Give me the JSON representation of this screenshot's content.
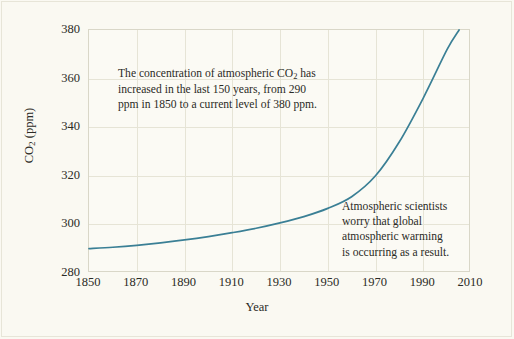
{
  "figure": {
    "background_color": "#faf9f2",
    "plot_background_color": "#fbfaf4",
    "frame_color": "#d9d7c8",
    "grid_color": "#e6e4d6",
    "line_color": "#3a7f95",
    "text_color": "#2b2b26"
  },
  "annotations": {
    "primary": "The concentration of atmospheric CO₂ has increased in the last 150 years, from 290 ppm in 1850 to a current level of 380 ppm.",
    "primary_lines": [
      "The concentration of atmospheric CO",
      "increased in the last 150 years, from 290",
      "ppm in 1850 to a current level of 380 ppm."
    ],
    "primary_prefix": "The concentration of atmospheric CO",
    "primary_sub": "2",
    "primary_suffix": " has",
    "secondary": "Atmospheric scientists worry that global atmospheric warming is occurring as a result.",
    "secondary_lines": [
      "Atmospheric scientists",
      "worry that global",
      "atmospheric warming",
      "is occurring as a result."
    ]
  },
  "axis": {
    "y_title_prefix": "CO",
    "y_title_sub": "2",
    "y_title_suffix": " (ppm)",
    "x_title": "Year",
    "x_ticks": [
      "1850",
      "1870",
      "1890",
      "1910",
      "1930",
      "1950",
      "1970",
      "1990",
      "2010"
    ],
    "y_ticks": [
      "380",
      "360",
      "340",
      "320",
      "300",
      "280"
    ]
  },
  "chart_data": {
    "type": "line",
    "title": "",
    "xlabel": "Year",
    "ylabel": "CO2 (ppm)",
    "xlim": [
      1850,
      2010
    ],
    "ylim": [
      280,
      380
    ],
    "xticks": [
      1850,
      1870,
      1890,
      1910,
      1930,
      1950,
      1970,
      1990,
      2010
    ],
    "yticks": [
      280,
      300,
      320,
      340,
      360,
      380
    ],
    "grid": true,
    "legend": false,
    "line_color": "#3a7f95",
    "series": [
      {
        "name": "Atmospheric CO2 concentration",
        "x": [
          1850,
          1860,
          1870,
          1880,
          1890,
          1900,
          1910,
          1920,
          1930,
          1940,
          1950,
          1960,
          1970,
          1980,
          1990,
          2000,
          2005
        ],
        "values": [
          290.0,
          290.6,
          291.4,
          292.4,
          293.6,
          295.0,
          296.6,
          298.4,
          300.6,
          303.2,
          306.6,
          311.4,
          320.0,
          334.0,
          352.0,
          372.0,
          380.0
        ]
      }
    ],
    "annotations": [
      {
        "text": "The concentration of atmospheric CO2 has increased in the last 150 years, from 290 ppm in 1850 to a current level of 380 ppm.",
        "x": 1862,
        "y": 367
      },
      {
        "text": "Atmospheric scientists worry that global atmospheric warming is occurring as a result.",
        "x": 1957,
        "y": 313
      }
    ]
  }
}
